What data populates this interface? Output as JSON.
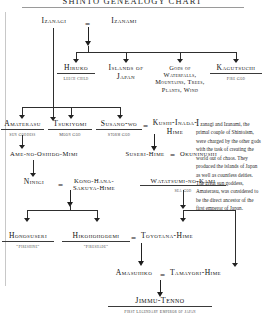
{
  "chart": {
    "title": "SHINTO GENEALOGY CHART",
    "type": "genealogy-tree",
    "nodes": [
      {
        "id": "izanagi",
        "name": "Izanagi",
        "subtitle": ""
      },
      {
        "id": "izanami",
        "name": "Izanami",
        "subtitle": ""
      },
      {
        "id": "hiruko",
        "name": "Hiruko",
        "subtitle": "Leech Child"
      },
      {
        "id": "islands",
        "name": "Islands of Japan",
        "subtitle": ""
      },
      {
        "id": "gods_nature",
        "name": "Gods of Waterfalls, Mountains, Trees, Plants, Wind",
        "subtitle": ""
      },
      {
        "id": "kagutsuchi",
        "name": "Kagutsuchi",
        "subtitle": "Fire God"
      },
      {
        "id": "amaterasu",
        "name": "Amaterasu",
        "subtitle": "Sun Goddess"
      },
      {
        "id": "tsukiyomi",
        "name": "Tsukiyomi",
        "subtitle": "Moon God"
      },
      {
        "id": "susanowo",
        "name": "Susano-wo",
        "subtitle": "Storm God"
      },
      {
        "id": "kushiinada",
        "name": "Kushi-Inada-Hime",
        "subtitle": ""
      },
      {
        "id": "amenooshido",
        "name": "Ame-no-Oshido-Mimi",
        "subtitle": ""
      },
      {
        "id": "suserihime",
        "name": "Suseri-Hime",
        "subtitle": ""
      },
      {
        "id": "okuninushi",
        "name": "Okuninushi",
        "subtitle": ""
      },
      {
        "id": "ninigi",
        "name": "Ninigi",
        "subtitle": ""
      },
      {
        "id": "konohana",
        "name": "Kono-Hana-Sakuya-Hime",
        "subtitle": ""
      },
      {
        "id": "watatsumi",
        "name": "Watatsumi-no-Kami",
        "subtitle": "Sea God"
      },
      {
        "id": "honosuseri",
        "name": "Honosuseri",
        "subtitle": "\"Fireshine\""
      },
      {
        "id": "hikohohodemi",
        "name": "Hikohohodemi",
        "subtitle": "\"Fireshade\""
      },
      {
        "id": "toyotana",
        "name": "Toyotana-Hime",
        "subtitle": ""
      },
      {
        "id": "amasuhiko",
        "name": "Amasuhiko",
        "subtitle": ""
      },
      {
        "id": "tamayori",
        "name": "Tamayori-Hime",
        "subtitle": ""
      },
      {
        "id": "jimmu",
        "name": "Jimmu-Tenno",
        "subtitle": "First Legendary Emperor of Japan"
      }
    ],
    "unions": [
      {
        "left": "izanagi",
        "right": "izanami"
      },
      {
        "left": "susanowo",
        "right": "kushiinada"
      },
      {
        "left": "suserihime",
        "right": "okuninushi"
      },
      {
        "left": "ninigi",
        "right": "konohana"
      },
      {
        "left": "hikohohodemi",
        "right": "toyotana"
      },
      {
        "left": "amasuhiko",
        "right": "tamayori"
      }
    ],
    "edges": [
      {
        "from": "izanagi+izanami",
        "to": "hiruko"
      },
      {
        "from": "izanagi+izanami",
        "to": "islands"
      },
      {
        "from": "izanagi+izanami",
        "to": "gods_nature"
      },
      {
        "from": "izanagi+izanami",
        "to": "kagutsuchi"
      },
      {
        "from": "izanagi",
        "to": "amaterasu"
      },
      {
        "from": "izanagi",
        "to": "tsukiyomi"
      },
      {
        "from": "izanagi",
        "to": "susanowo"
      },
      {
        "from": "amaterasu",
        "to": "amenooshido"
      },
      {
        "from": "susanowo+kushiinada",
        "to": "suserihime"
      },
      {
        "from": "amenooshido",
        "to": "ninigi"
      },
      {
        "from": "ninigi+konohana",
        "to": "honosuseri"
      },
      {
        "from": "ninigi+konohana",
        "to": "hikohohodemi"
      },
      {
        "from": "watatsumi",
        "to": "toyotana"
      },
      {
        "from": "hikohohodemi+toyotana",
        "to": "amasuhiko"
      },
      {
        "from": "watatsumi",
        "to": "tamayori"
      },
      {
        "from": "amasuhiko+tamayori",
        "to": "jimmu"
      }
    ]
  },
  "sidenote": {
    "dropcap": "I",
    "text": "zanagi and Izanami, the primal couple of Shintoism, were charged by the other gods with the task of creating the world out of chaos. They produced the islands of Japan as well as countless deities. The great sun goddess, Amaterasu, was considered to be the direct ancestor of the first emperor of Japan."
  }
}
